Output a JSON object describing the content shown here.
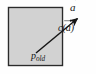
{
  "figure": {
    "name": "vector-displacement-diagram",
    "background_color": "#fefefe",
    "region": {
      "name": "gray-square-region",
      "fill_color": "#d2d2d2",
      "stroke_color": "#2b2b2b",
      "x": 8,
      "y": 7,
      "width": 55,
      "height": 59
    },
    "vector": {
      "name": "displacement-vector",
      "stroke_color": "#161616",
      "start_x": 36,
      "start_y": 53,
      "end_x": 79,
      "end_y": 17,
      "arrowhead": "filled-triangle"
    },
    "labels": {
      "vector_a": {
        "text": "a",
        "accent": "vector-arrow",
        "full": "a⃗",
        "x": 70,
        "y": 2
      },
      "c_of_a": {
        "prefix": "c",
        "open_paren": "(",
        "argument": "a",
        "argument_accent": "vector-arrow",
        "close_paren": ")",
        "full": "c(a⃗)",
        "x": 58,
        "y": 23
      },
      "p_old": {
        "base": "p",
        "subscript": "old",
        "full": "p_old",
        "x": 31,
        "y": 51
      }
    }
  }
}
